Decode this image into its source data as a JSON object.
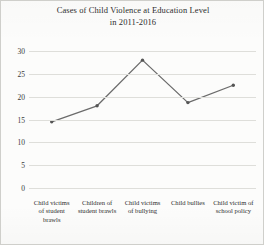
{
  "chart_data": {
    "type": "line",
    "title": "Cases of Child Violence at Education Level in 2011-2016",
    "title_lines": [
      "Cases of Child Violence at Education Level",
      "in 2011-2016"
    ],
    "categories": [
      "Child victims of student brawls",
      "Children of student brawls",
      "Child victims of bullying",
      "Child bullies",
      "Child victim of school policy"
    ],
    "category_lines": [
      [
        "Child victims",
        "of student",
        "brawls"
      ],
      [
        "Children of",
        "student brawls"
      ],
      [
        "Child victims",
        "of bullying"
      ],
      [
        "Child bullies"
      ],
      [
        "Child victim of",
        "school policy"
      ]
    ],
    "values": [
      14.5,
      18,
      28,
      18.7,
      22.5
    ],
    "xlabel": "",
    "ylabel": "",
    "ylim": [
      0,
      30
    ],
    "ytick_values": [
      0,
      5,
      10,
      15,
      20,
      25,
      30
    ],
    "ytick_labels": [
      "0",
      "5",
      "10",
      "15",
      "20",
      "25",
      "30"
    ],
    "grid": true,
    "legend": false,
    "series_color": "#6b6b6b",
    "gridline_color": "#dedeD a"
  },
  "style": {
    "line_color": "#6b6b6b",
    "marker_color": "#555555",
    "grid_color": "#dededa",
    "text_color": "#2e2e2e",
    "background": "#fcfcfb",
    "border_color": "#cfcfcb"
  }
}
